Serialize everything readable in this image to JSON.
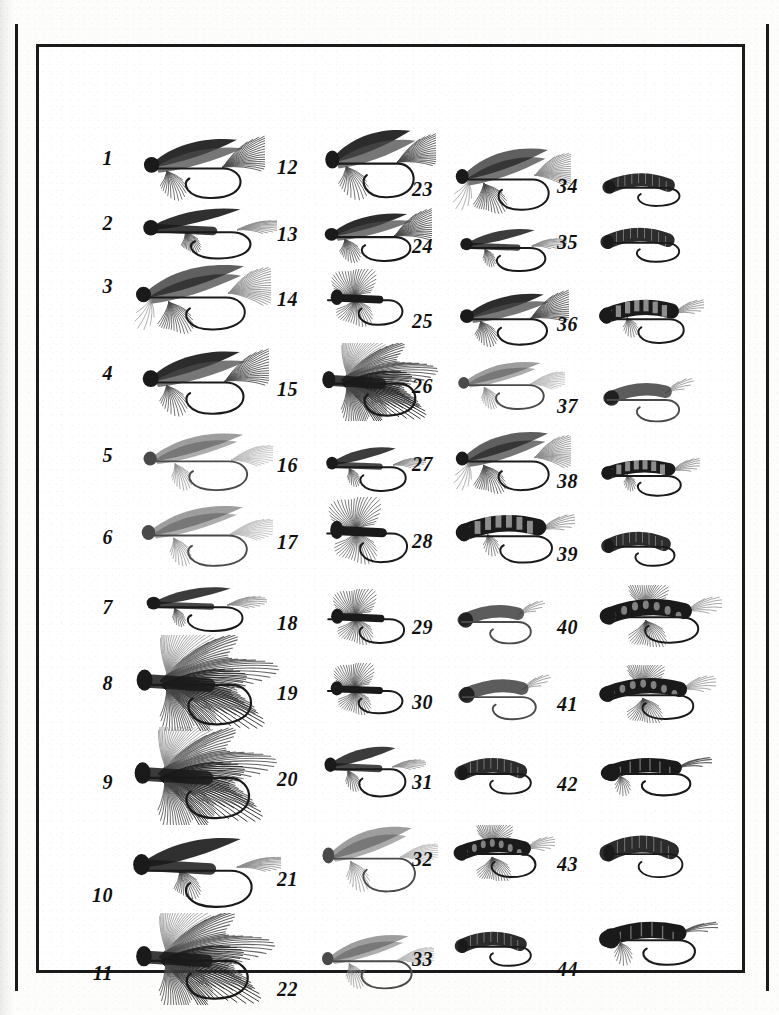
{
  "plate": {
    "kind": "book-plate-photograph",
    "description": "Numbered photographic plate of 44 artificial fishing flies",
    "specimen_count": 44,
    "frame_color": "#1b1b1b",
    "background_color": "#ffffff",
    "number_style": "italic-serif-bold"
  },
  "columns": [
    {
      "id": "column-1",
      "specimens": [
        {
          "number": "1",
          "label_x": 0,
          "label_y": 113,
          "art": "wet-fly-dark-wing",
          "art_w": 140,
          "art_h": 72,
          "art_x": 46,
          "art_y": 84,
          "scale": 1.0
        },
        {
          "number": "2",
          "label_x": 0,
          "label_y": 178,
          "art": "wet-fly-tail-streamer",
          "art_w": 152,
          "art_h": 64,
          "art_x": 46,
          "art_y": 152,
          "scale": 1.0
        },
        {
          "number": "3",
          "label_x": 0,
          "label_y": 241,
          "art": "wet-fly-long-hackle",
          "art_w": 150,
          "art_h": 78,
          "art_x": 42,
          "art_y": 210,
          "scale": 1.05
        },
        {
          "number": "4",
          "label_x": 0,
          "label_y": 328,
          "art": "wet-fly-dark-wing",
          "art_w": 146,
          "art_h": 76,
          "art_x": 44,
          "art_y": 296,
          "scale": 1.02
        },
        {
          "number": "5",
          "label_x": 0,
          "label_y": 410,
          "art": "wet-fly-pale-wing",
          "art_w": 148,
          "art_h": 70,
          "art_x": 46,
          "art_y": 378,
          "scale": 0.98
        },
        {
          "number": "6",
          "label_x": 0,
          "label_y": 492,
          "art": "wet-fly-pale-wing",
          "art_w": 150,
          "art_h": 74,
          "art_x": 44,
          "art_y": 450,
          "scale": 1.0
        },
        {
          "number": "7",
          "label_x": 0,
          "label_y": 562,
          "art": "wet-fly-slim",
          "art_w": 140,
          "art_h": 58,
          "art_x": 48,
          "art_y": 530,
          "scale": 0.95
        },
        {
          "number": "8",
          "label_x": 0,
          "label_y": 638,
          "art": "streamer-bushy",
          "art_w": 160,
          "art_h": 96,
          "art_x": 40,
          "art_y": 588,
          "scale": 1.12
        },
        {
          "number": "9",
          "label_x": 0,
          "label_y": 737,
          "art": "streamer-bushy",
          "art_w": 160,
          "art_h": 98,
          "art_x": 38,
          "art_y": 680,
          "scale": 1.1
        },
        {
          "number": "10",
          "label_x": 0,
          "label_y": 850,
          "art": "wet-fly-tail-streamer",
          "art_w": 168,
          "art_h": 88,
          "art_x": 34,
          "art_y": 778,
          "scale": 1.08
        },
        {
          "number": "11",
          "label_x": 0,
          "label_y": 928,
          "art": "streamer-bushy",
          "art_w": 156,
          "art_h": 92,
          "art_x": 40,
          "art_y": 866,
          "scale": 1.06
        }
      ]
    },
    {
      "id": "column-2",
      "specimens": [
        {
          "number": "12",
          "label_x": 0,
          "label_y": 122,
          "art": "wet-fly-dark-wing",
          "art_w": 128,
          "art_h": 82,
          "art_x": 44,
          "art_y": 74,
          "scale": 1.02
        },
        {
          "number": "13",
          "label_x": 0,
          "label_y": 189,
          "art": "wet-fly-dark-wing",
          "art_w": 124,
          "art_h": 58,
          "art_x": 44,
          "art_y": 160,
          "scale": 0.92
        },
        {
          "number": "14",
          "label_x": 0,
          "label_y": 254,
          "art": "wet-fly-spider",
          "art_w": 112,
          "art_h": 60,
          "art_x": 46,
          "art_y": 222,
          "scale": 0.86
        },
        {
          "number": "15",
          "label_x": 0,
          "label_y": 344,
          "art": "streamer-bushy",
          "art_w": 130,
          "art_h": 78,
          "art_x": 44,
          "art_y": 296,
          "scale": 0.95
        },
        {
          "number": "16",
          "label_x": 0,
          "label_y": 420,
          "art": "wet-fly-slim",
          "art_w": 116,
          "art_h": 58,
          "art_x": 46,
          "art_y": 390,
          "scale": 0.85
        },
        {
          "number": "17",
          "label_x": 0,
          "label_y": 497,
          "art": "wet-fly-spider",
          "art_w": 120,
          "art_h": 70,
          "art_x": 44,
          "art_y": 450,
          "scale": 0.92
        },
        {
          "number": "18",
          "label_x": 0,
          "label_y": 578,
          "art": "wet-fly-spider",
          "art_w": 114,
          "art_h": 58,
          "art_x": 46,
          "art_y": 542,
          "scale": 0.84
        },
        {
          "number": "19",
          "label_x": 0,
          "label_y": 648,
          "art": "wet-fly-spider",
          "art_w": 112,
          "art_h": 54,
          "art_x": 46,
          "art_y": 616,
          "scale": 0.82
        },
        {
          "number": "20",
          "label_x": 0,
          "label_y": 734,
          "art": "wet-fly-slim",
          "art_w": 118,
          "art_h": 66,
          "art_x": 44,
          "art_y": 688,
          "scale": 0.88
        },
        {
          "number": "21",
          "label_x": 0,
          "label_y": 834,
          "art": "wet-fly-pale-wing",
          "art_w": 132,
          "art_h": 80,
          "art_x": 42,
          "art_y": 770,
          "scale": 0.98
        },
        {
          "number": "22",
          "label_x": 0,
          "label_y": 944,
          "art": "wet-fly-pale-wing",
          "art_w": 128,
          "art_h": 66,
          "art_x": 42,
          "art_y": 880,
          "scale": 0.94
        }
      ]
    },
    {
      "id": "column-3",
      "specimens": [
        {
          "number": "23",
          "label_x": 0,
          "label_y": 144,
          "art": "wet-fly-long-hackle",
          "art_w": 128,
          "art_h": 74,
          "art_x": 44,
          "art_y": 94,
          "scale": 0.96
        },
        {
          "number": "24",
          "label_x": 0,
          "label_y": 201,
          "art": "wet-fly-slim",
          "art_w": 124,
          "art_h": 56,
          "art_x": 44,
          "art_y": 172,
          "scale": 0.9
        },
        {
          "number": "25",
          "label_x": 0,
          "label_y": 276,
          "art": "wet-fly-dark-wing",
          "art_w": 126,
          "art_h": 62,
          "art_x": 44,
          "art_y": 240,
          "scale": 0.92
        },
        {
          "number": "26",
          "label_x": 0,
          "label_y": 341,
          "art": "wet-fly-pale-wing",
          "art_w": 122,
          "art_h": 58,
          "art_x": 44,
          "art_y": 308,
          "scale": 0.88
        },
        {
          "number": "27",
          "label_x": 0,
          "label_y": 419,
          "art": "wet-fly-long-hackle",
          "art_w": 128,
          "art_h": 70,
          "art_x": 44,
          "art_y": 378,
          "scale": 0.93
        },
        {
          "number": "28",
          "label_x": 0,
          "label_y": 496,
          "art": "nymph-segmented",
          "art_w": 132,
          "art_h": 64,
          "art_x": 44,
          "art_y": 456,
          "scale": 0.96
        },
        {
          "number": "29",
          "label_x": 0,
          "label_y": 582,
          "art": "nymph-plain",
          "art_w": 104,
          "art_h": 52,
          "art_x": 46,
          "art_y": 548,
          "scale": 0.8
        },
        {
          "number": "30",
          "label_x": 0,
          "label_y": 657,
          "art": "nymph-plain",
          "art_w": 110,
          "art_h": 54,
          "art_x": 46,
          "art_y": 622,
          "scale": 0.82
        },
        {
          "number": "31",
          "label_x": 0,
          "label_y": 737,
          "art": "scud-curved",
          "art_w": 104,
          "art_h": 48,
          "art_x": 46,
          "art_y": 702,
          "scale": 0.8
        },
        {
          "number": "32",
          "label_x": 0,
          "label_y": 814,
          "art": "nymph-legged",
          "art_w": 112,
          "art_h": 56,
          "art_x": 44,
          "art_y": 778,
          "scale": 0.84
        },
        {
          "number": "33",
          "label_x": 0,
          "label_y": 914,
          "art": "scud-curved",
          "art_w": 104,
          "art_h": 46,
          "art_x": 46,
          "art_y": 876,
          "scale": 0.8
        }
      ]
    },
    {
      "id": "column-4",
      "specimens": [
        {
          "number": "34",
          "label_x": 0,
          "label_y": 141,
          "art": "scud-curved",
          "art_w": 106,
          "art_h": 44,
          "art_x": 48,
          "art_y": 118,
          "scale": 0.82
        },
        {
          "number": "35",
          "label_x": 0,
          "label_y": 197,
          "art": "scud-curved",
          "art_w": 108,
          "art_h": 46,
          "art_x": 46,
          "art_y": 172,
          "scale": 0.84
        },
        {
          "number": "36",
          "label_x": 0,
          "label_y": 279,
          "art": "nymph-segmented",
          "art_w": 116,
          "art_h": 58,
          "art_x": 44,
          "art_y": 242,
          "scale": 0.88
        },
        {
          "number": "37",
          "label_x": 0,
          "label_y": 361,
          "art": "nymph-plain",
          "art_w": 108,
          "art_h": 52,
          "art_x": 46,
          "art_y": 326,
          "scale": 0.82
        },
        {
          "number": "38",
          "label_x": 0,
          "label_y": 436,
          "art": "nymph-segmented",
          "art_w": 110,
          "art_h": 48,
          "art_x": 46,
          "art_y": 404,
          "scale": 0.82
        },
        {
          "number": "39",
          "label_x": 0,
          "label_y": 509,
          "art": "scud-curved",
          "art_w": 100,
          "art_h": 46,
          "art_x": 48,
          "art_y": 476,
          "scale": 0.78
        },
        {
          "number": "40",
          "label_x": 0,
          "label_y": 582,
          "art": "nymph-legged",
          "art_w": 136,
          "art_h": 62,
          "art_x": 42,
          "art_y": 538,
          "scale": 1.0
        },
        {
          "number": "41",
          "label_x": 0,
          "label_y": 659,
          "art": "nymph-legged",
          "art_w": 130,
          "art_h": 58,
          "art_x": 42,
          "art_y": 618,
          "scale": 0.96
        },
        {
          "number": "42",
          "label_x": 0,
          "label_y": 739,
          "art": "nymph-tailed",
          "art_w": 124,
          "art_h": 52,
          "art_x": 44,
          "art_y": 700,
          "scale": 0.92
        },
        {
          "number": "43",
          "label_x": 0,
          "label_y": 819,
          "art": "scud-curved",
          "art_w": 112,
          "art_h": 56,
          "art_x": 46,
          "art_y": 778,
          "scale": 0.88
        },
        {
          "number": "44",
          "label_x": 0,
          "label_y": 924,
          "art": "nymph-tailed",
          "art_w": 132,
          "art_h": 60,
          "art_x": 42,
          "art_y": 862,
          "scale": 0.98
        }
      ]
    }
  ]
}
